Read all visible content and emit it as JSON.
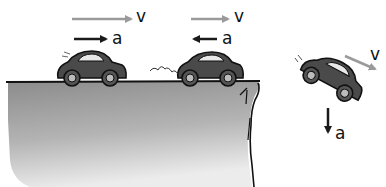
{
  "figure": {
    "colors": {
      "velocity_arrow": "#9a9a9a",
      "acceleration_arrow": "#1a1a1a",
      "car_body": "#4a4a4a",
      "ground_top": "#8a8a8a",
      "ground_bottom": "#e6e6e6",
      "outline": "#111111"
    }
  },
  "scenes": [
    {
      "name": "speeding-up",
      "velocity_label": "v",
      "acceleration_label": "a",
      "velocity_dir": "right",
      "acceleration_dir": "right"
    },
    {
      "name": "slowing-down",
      "velocity_label": "v",
      "acceleration_label": "a",
      "velocity_dir": "right",
      "acceleration_dir": "left"
    },
    {
      "name": "falling-off-cliff",
      "velocity_label": "v",
      "acceleration_label": "a",
      "velocity_dir": "down-right",
      "acceleration_dir": "down"
    }
  ]
}
